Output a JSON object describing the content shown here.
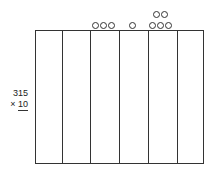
{
  "problem": {
    "multiplicand": "315",
    "operator": "×",
    "multiplier": "10"
  },
  "place_value_chart": {
    "columns": 6,
    "disc_groups": [
      {
        "column": 3,
        "count": 3
      },
      {
        "column": 4,
        "count": 1
      },
      {
        "column": 5,
        "count": 5
      }
    ]
  }
}
